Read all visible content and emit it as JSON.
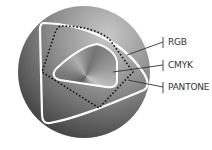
{
  "diagram": {
    "type": "color-gamut-comparison",
    "background_color": "#ffffff",
    "sphere": {
      "center": [
        84,
        72
      ],
      "radius": 66,
      "gradient_light": "#c4c4c4",
      "gradient_dark": "#333333"
    },
    "gamuts": [
      {
        "name": "RGB",
        "style": "solid-white",
        "color": "#ffffff"
      },
      {
        "name": "CMYK",
        "style": "solid-white",
        "color": "#ffffff"
      },
      {
        "name": "PANTONE",
        "style": "dotted-black",
        "color": "#111111"
      }
    ],
    "labels": {
      "rgb": "RGB",
      "cmyk": "CMYK",
      "pantone": "PANTONE"
    },
    "leader_color": "#333333"
  }
}
